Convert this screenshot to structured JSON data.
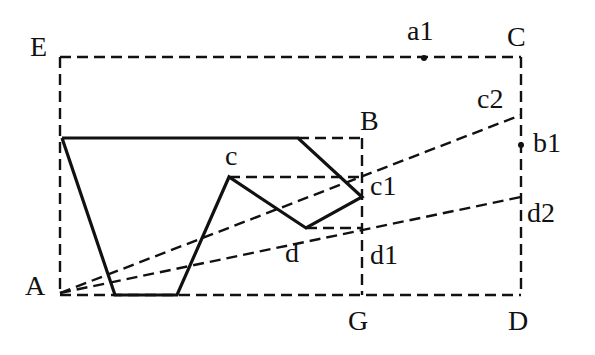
{
  "diagram": {
    "type": "geometric-construction",
    "stroke_color": "#111111",
    "background": "#ffffff",
    "points": {
      "E": {
        "label": "E",
        "x": 60,
        "y": 57
      },
      "C": {
        "label": "C",
        "x": 521,
        "y": 57
      },
      "D": {
        "label": "D",
        "x": 521,
        "y": 295
      },
      "A": {
        "label": "A",
        "x": 60,
        "y": 293
      },
      "G": {
        "label": "G",
        "x": 362,
        "y": 295
      },
      "B": {
        "label": "B",
        "x": 362,
        "y": 138
      },
      "a1": {
        "label": "a1",
        "x": 424,
        "y": 58
      },
      "b1": {
        "label": "b1",
        "x": 521,
        "y": 145
      },
      "c": {
        "label": "c",
        "x": 229,
        "y": 177
      },
      "c1": {
        "label": "c1",
        "x": 362,
        "y": 177
      },
      "c2": {
        "label": "c2",
        "x": 521,
        "y": 115
      },
      "d": {
        "label": "d",
        "x": 306,
        "y": 228
      },
      "d1": {
        "label": "d1",
        "x": 362,
        "y": 228
      },
      "d2": {
        "label": "d2",
        "x": 521,
        "y": 197
      }
    },
    "solid_polygon": [
      [
        62,
        138
      ],
      [
        298,
        138
      ],
      [
        362,
        197
      ],
      [
        306,
        228
      ],
      [
        229,
        177
      ],
      [
        177,
        295
      ],
      [
        115,
        295
      ],
      [
        62,
        138
      ]
    ],
    "dashed_segments": [
      [
        [
          60,
          57
        ],
        [
          521,
          57
        ]
      ],
      [
        [
          521,
          57
        ],
        [
          521,
          295
        ]
      ],
      [
        [
          60,
          295
        ],
        [
          521,
          295
        ]
      ],
      [
        [
          60,
          57
        ],
        [
          60,
          295
        ]
      ],
      [
        [
          298,
          138
        ],
        [
          362,
          138
        ]
      ],
      [
        [
          362,
          138
        ],
        [
          362,
          295
        ]
      ],
      [
        [
          229,
          177
        ],
        [
          362,
          177
        ]
      ],
      [
        [
          306,
          228
        ],
        [
          362,
          228
        ]
      ],
      [
        [
          60,
          293
        ],
        [
          521,
          115
        ]
      ],
      [
        [
          60,
          293
        ],
        [
          521,
          197
        ]
      ]
    ],
    "dots": [
      "a1",
      "b1"
    ]
  }
}
